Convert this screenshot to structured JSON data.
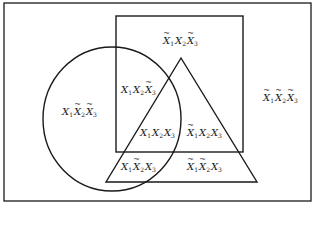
{
  "diagram": {
    "title": "",
    "colors": {
      "stroke": "#1a1a1a",
      "background": "#ffffff"
    },
    "frame": {
      "x": 4,
      "y": 3,
      "width": 307,
      "height": 198
    },
    "sets": {
      "X1": {
        "shape": "circle",
        "cx": 112,
        "cy": 119,
        "rx": 69,
        "ry": 72
      },
      "X2": {
        "shape": "square",
        "x": 116,
        "y": 16,
        "width": 127,
        "height": 136
      },
      "X3": {
        "shape": "triangle",
        "points": [
          [
            181,
            58
          ],
          [
            106,
            182
          ],
          [
            257,
            182
          ]
        ]
      }
    },
    "regions": [
      {
        "id": "n1-x2-n3",
        "text": "~X1 X2 ~X3",
        "terms": [
          {
            "v": "X",
            "s": "1",
            "neg": true
          },
          {
            "v": "X",
            "s": "2",
            "neg": false
          },
          {
            "v": "X",
            "s": "3",
            "neg": true
          }
        ],
        "x": 181,
        "y": 41
      },
      {
        "id": "x1-x2-n3",
        "text": "X1 X2 ~X3",
        "terms": [
          {
            "v": "X",
            "s": "1",
            "neg": false
          },
          {
            "v": "X",
            "s": "2",
            "neg": false
          },
          {
            "v": "X",
            "s": "3",
            "neg": true
          }
        ],
        "x": 139,
        "y": 90
      },
      {
        "id": "x1-n2-n3",
        "text": "X1 ~X2 ~X3",
        "terms": [
          {
            "v": "X",
            "s": "1",
            "neg": false
          },
          {
            "v": "X",
            "s": "2",
            "neg": true
          },
          {
            "v": "X",
            "s": "3",
            "neg": true
          }
        ],
        "x": 80,
        "y": 112
      },
      {
        "id": "n1-n2-n3",
        "text": "~X1 ~X2 ~X3",
        "terms": [
          {
            "v": "X",
            "s": "1",
            "neg": true
          },
          {
            "v": "X",
            "s": "2",
            "neg": true
          },
          {
            "v": "X",
            "s": "3",
            "neg": true
          }
        ],
        "x": 281,
        "y": 98
      },
      {
        "id": "x1-x2-x3",
        "text": "X1 X2 X3",
        "terms": [
          {
            "v": "X",
            "s": "1",
            "neg": false
          },
          {
            "v": "X",
            "s": "2",
            "neg": false
          },
          {
            "v": "X",
            "s": "3",
            "neg": false
          }
        ],
        "x": 158,
        "y": 133
      },
      {
        "id": "n1-x2-x3",
        "text": "~X1 X2 X3",
        "terms": [
          {
            "v": "X",
            "s": "1",
            "neg": true
          },
          {
            "v": "X",
            "s": "2",
            "neg": false
          },
          {
            "v": "X",
            "s": "3",
            "neg": false
          }
        ],
        "x": 205,
        "y": 133
      },
      {
        "id": "x1-n2-x3",
        "text": "X1 ~X2 X3",
        "terms": [
          {
            "v": "X",
            "s": "1",
            "neg": false
          },
          {
            "v": "X",
            "s": "2",
            "neg": true
          },
          {
            "v": "X",
            "s": "3",
            "neg": false
          }
        ],
        "x": 139,
        "y": 167
      },
      {
        "id": "n1-n2-x3",
        "text": "~X1 ~X2 X3",
        "terms": [
          {
            "v": "X",
            "s": "1",
            "neg": true
          },
          {
            "v": "X",
            "s": "2",
            "neg": true
          },
          {
            "v": "X",
            "s": "3",
            "neg": false
          }
        ],
        "x": 205,
        "y": 167
      }
    ]
  }
}
